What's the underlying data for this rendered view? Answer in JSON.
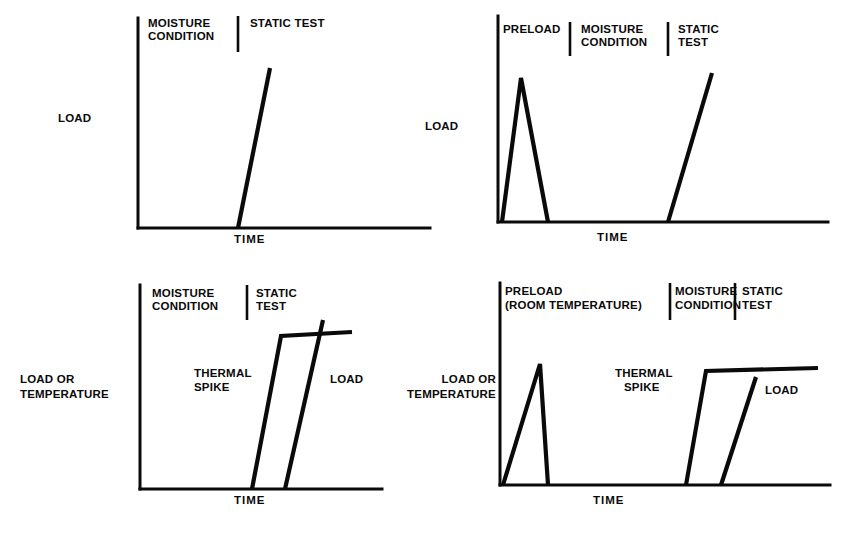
{
  "figure": {
    "background_color": "#ffffff",
    "ink_color": "#0a0a0a",
    "panel_count": 4
  },
  "chart_data": {
    "type": "line",
    "title": "",
    "subtitle": "",
    "xlabel": "TIME",
    "ylabel": "LOAD",
    "grid": false,
    "legend": "none",
    "panels": [
      {
        "id": "panel-top-left",
        "position": "top-left",
        "ylabel": "LOAD",
        "ylabel_lines": [
          "LOAD"
        ],
        "xlabel": "TIME",
        "phases": [
          {
            "label_lines": [
              "MOISTURE",
              "CONDITION"
            ],
            "label": "MOISTURE CONDITION"
          },
          {
            "label_lines": [
              "STATIC TEST"
            ],
            "label": "STATIC TEST"
          }
        ],
        "series": [
          {
            "name": "STATIC TEST",
            "points": [
              [
                238,
                228
              ],
              [
                270,
                68
              ]
            ]
          }
        ],
        "inplot_labels": [],
        "axis": {
          "x_origin": 138,
          "y_baseline": 228,
          "y_top": 18,
          "x_end": 430
        },
        "dividers": [
          238
        ]
      },
      {
        "id": "panel-top-right",
        "position": "top-right",
        "ylabel": "LOAD",
        "ylabel_lines": [
          "LOAD"
        ],
        "xlabel": "TIME",
        "phases": [
          {
            "label_lines": [
              "PRELOAD"
            ],
            "label": "PRELOAD"
          },
          {
            "label_lines": [
              "MOISTURE",
              "CONDITION"
            ],
            "label": "MOISTURE CONDITION"
          },
          {
            "label_lines": [
              "STATIC",
              "TEST"
            ],
            "label": "STATIC TEST"
          }
        ],
        "series": [
          {
            "name": "PRELOAD",
            "points": [
              [
                502,
                222
              ],
              [
                521,
                78
              ],
              [
                548,
                222
              ]
            ]
          },
          {
            "name": "STATIC TEST",
            "points": [
              [
                668,
                222
              ],
              [
                712,
                73
              ]
            ]
          }
        ],
        "inplot_labels": [],
        "axis": {
          "x_origin": 498,
          "y_baseline": 222,
          "y_top": 16,
          "x_end": 828
        },
        "dividers": [
          570,
          668
        ]
      },
      {
        "id": "panel-bottom-left",
        "position": "bottom-left",
        "ylabel": "LOAD OR TEMPERATURE",
        "ylabel_lines": [
          "LOAD OR",
          "TEMPERATURE"
        ],
        "xlabel": "TIME",
        "phases": [
          {
            "label_lines": [
              "MOISTURE",
              "CONDITION"
            ],
            "label": "MOISTURE CONDITION"
          },
          {
            "label_lines": [
              "STATIC",
              "TEST"
            ],
            "label": "STATIC TEST"
          }
        ],
        "series": [
          {
            "name": "THERMAL SPIKE",
            "points": [
              [
                252,
                489
              ],
              [
                281,
                336
              ],
              [
                352,
                332
              ]
            ]
          },
          {
            "name": "LOAD",
            "points": [
              [
                285,
                489
              ],
              [
                323,
                320
              ]
            ]
          }
        ],
        "inplot_labels": [
          {
            "text_lines": [
              "THERMAL",
              "SPIKE"
            ],
            "text": "THERMAL SPIKE"
          },
          {
            "text_lines": [
              "LOAD"
            ],
            "text": "LOAD"
          }
        ],
        "axis": {
          "x_origin": 140,
          "y_baseline": 489,
          "y_top": 285,
          "x_end": 382
        },
        "dividers": [
          247
        ]
      },
      {
        "id": "panel-bottom-right",
        "position": "bottom-right",
        "ylabel": "LOAD OR TEMPERATURE",
        "ylabel_lines": [
          "LOAD OR",
          "TEMPERATURE"
        ],
        "xlabel": "TIME",
        "phases": [
          {
            "label_lines": [
              "PRELOAD",
              "(ROOM TEMPERATURE)"
            ],
            "label": "PRELOAD (ROOM TEMPERATURE)"
          },
          {
            "label_lines": [
              "MOISTURE",
              "CONDITION"
            ],
            "label": "MOISTURE CONDITION"
          },
          {
            "label_lines": [
              "STATIC",
              "TEST"
            ],
            "label": "STATIC TEST"
          }
        ],
        "series": [
          {
            "name": "PRELOAD",
            "points": [
              [
                503,
                485
              ],
              [
                540,
                364
              ],
              [
                548,
                485
              ]
            ]
          },
          {
            "name": "THERMAL SPIKE",
            "points": [
              [
                686,
                485
              ],
              [
                706,
                371
              ],
              [
                818,
                368
              ]
            ]
          },
          {
            "name": "LOAD",
            "points": [
              [
                721,
                485
              ],
              [
                756,
                377
              ]
            ]
          }
        ],
        "inplot_labels": [
          {
            "text_lines": [
              "THERMAL",
              "SPIKE"
            ],
            "text": "THERMAL SPIKE"
          },
          {
            "text_lines": [
              "LOAD"
            ],
            "text": "LOAD"
          }
        ],
        "axis": {
          "x_origin": 500,
          "y_baseline": 485,
          "y_top": 283,
          "x_end": 830
        },
        "dividers": [
          670,
          735
        ]
      }
    ]
  },
  "labels": {
    "time": "TIME",
    "load": "LOAD",
    "load_or": "LOAD OR",
    "temperature": "TEMPERATURE",
    "moisture": "MOISTURE",
    "condition": "CONDITION",
    "static_test_one_line": "STATIC TEST",
    "static": "STATIC",
    "test": "TEST",
    "preload": "PRELOAD",
    "room_temperature": "(ROOM TEMPERATURE)",
    "thermal": "THERMAL",
    "spike": "SPIKE"
  }
}
